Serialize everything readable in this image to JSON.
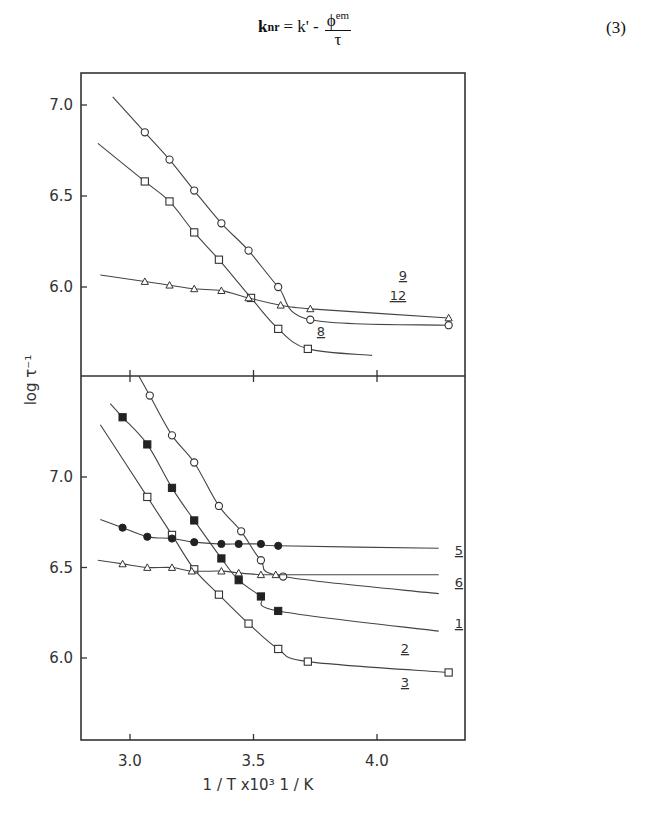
{
  "equation": {
    "lhs": "k",
    "lhs_sub": "nr",
    "rhs_prefix": "= k' -",
    "numerator": "ϕ",
    "numerator_sup": "em",
    "denominator": "τ",
    "number": "(3)"
  },
  "chart_data": {
    "type": "scatter",
    "title": "",
    "xlabel": "1 / T  x10³    1 / K",
    "ylabel": "log τ⁻¹",
    "grid": false,
    "legend_position": "inline curve labels at right end",
    "panels": [
      {
        "name": "upper",
        "xlim": [
          2.8,
          4.4
        ],
        "ylim": [
          5.5,
          7.2
        ],
        "x_ticks": [
          3.0,
          3.5,
          4.0
        ],
        "y_ticks": [
          6.0,
          6.5,
          7.0
        ],
        "y_tick_labels": [
          "6.0",
          "6.5",
          "7.0"
        ],
        "series": [
          {
            "name": "12",
            "marker": "open-circle",
            "x": [
              3.06,
              3.16,
              3.26,
              3.37,
              3.48,
              3.6,
              3.73,
              4.29
            ],
            "y": [
              6.85,
              6.7,
              6.53,
              6.35,
              6.2,
              6.0,
              5.82,
              5.79
            ]
          },
          {
            "name": "8",
            "marker": "open-square",
            "x": [
              3.06,
              3.16,
              3.26,
              3.36,
              3.49,
              3.6,
              3.72
            ],
            "y": [
              6.58,
              6.47,
              6.3,
              6.15,
              5.94,
              5.77,
              5.66
            ]
          },
          {
            "name": "9",
            "marker": "open-triangle",
            "x": [
              3.06,
              3.16,
              3.26,
              3.37,
              3.48,
              3.61,
              3.73,
              4.29
            ],
            "y": [
              6.03,
              6.01,
              5.99,
              5.98,
              5.94,
              5.9,
              5.88,
              5.83
            ]
          }
        ]
      },
      {
        "name": "lower",
        "xlim": [
          2.8,
          4.4
        ],
        "ylim": [
          5.6,
          7.5
        ],
        "x_ticks": [
          3.0,
          3.5,
          4.0
        ],
        "x_tick_labels": [
          "3.0",
          "3.5",
          "4.0"
        ],
        "y_ticks": [
          6.0,
          6.5,
          7.0
        ],
        "y_tick_labels": [
          "6.0",
          "6.5",
          "7.0"
        ],
        "series": [
          {
            "name": "1",
            "marker": "open-circle",
            "x": [
              3.08,
              3.17,
              3.26,
              3.36,
              3.45,
              3.53,
              3.62
            ],
            "y": [
              7.45,
              7.23,
              7.08,
              6.84,
              6.7,
              6.54,
              6.45
            ]
          },
          {
            "name": "2",
            "marker": "filled-square",
            "x": [
              2.97,
              3.07,
              3.17,
              3.26,
              3.37,
              3.44,
              3.53,
              3.6
            ],
            "y": [
              7.33,
              7.18,
              6.94,
              6.76,
              6.55,
              6.43,
              6.34,
              6.26
            ]
          },
          {
            "name": "3",
            "marker": "open-square",
            "x": [
              3.07,
              3.17,
              3.26,
              3.36,
              3.48,
              3.6,
              3.72,
              4.29
            ],
            "y": [
              6.89,
              6.68,
              6.49,
              6.35,
              6.19,
              6.05,
              5.98,
              5.92
            ]
          },
          {
            "name": "5",
            "marker": "filled-circle",
            "x": [
              2.97,
              3.07,
              3.17,
              3.26,
              3.37,
              3.44,
              3.53,
              3.6
            ],
            "y": [
              6.72,
              6.67,
              6.66,
              6.64,
              6.63,
              6.63,
              6.63,
              6.62
            ]
          },
          {
            "name": "6",
            "marker": "open-triangle",
            "x": [
              2.97,
              3.07,
              3.17,
              3.25,
              3.37,
              3.44,
              3.53,
              3.59
            ],
            "y": [
              6.52,
              6.5,
              6.5,
              6.48,
              6.48,
              6.47,
              6.46,
              6.46
            ]
          }
        ]
      }
    ]
  }
}
